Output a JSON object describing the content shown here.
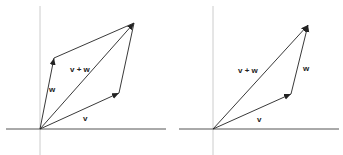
{
  "left_panel": {
    "labels": {
      "v": "v",
      "w": "w",
      "sum": "v + w"
    }
  },
  "right_panel": {
    "labels": {
      "v": "v",
      "w": "w",
      "sum": "v + w"
    }
  },
  "colors": {
    "vector": "#222222",
    "axis": "#555555",
    "axis_light": "#cccccc"
  }
}
